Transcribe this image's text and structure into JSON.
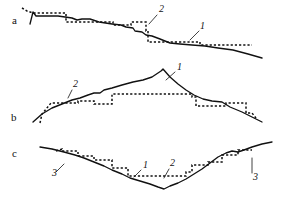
{
  "figure": {
    "width": 281,
    "height": 198,
    "background_color": "#ffffff",
    "stroke_color": "#111111",
    "panels": [
      {
        "id": "panel-a",
        "letter": "a",
        "letter_pos": [
          12,
          24
        ],
        "description": "Descending profile with stepped dashed approximation",
        "callouts": [
          {
            "label": "2",
            "pos": [
              159,
              12
            ],
            "leader": "M 157 15 L 149 24"
          },
          {
            "label": "1",
            "pos": [
              200,
              29
            ],
            "leader": "M 199 31 L 190 40"
          }
        ]
      },
      {
        "id": "panel-b",
        "letter": "b",
        "letter_pos": [
          11,
          121
        ],
        "description": "Peak (ridge) profile with stepped dashed approximation",
        "callouts": [
          {
            "label": "1",
            "pos": [
              177,
              70
            ],
            "leader": "M 175 72 L 166 80"
          },
          {
            "label": "2",
            "pos": [
              73,
              87
            ],
            "leader": "M 72 90 L 68 98"
          }
        ]
      },
      {
        "id": "panel-c",
        "letter": "c",
        "letter_pos": [
          12,
          157
        ],
        "description": "Valley (trough) profile with stepped dashed approximation",
        "callouts": [
          {
            "label": "3",
            "pos": [
              52,
              176
            ],
            "leader": "M 56 172 L 64 164"
          },
          {
            "label": "1",
            "pos": [
              143,
              168
            ],
            "leader": "M 141 170 L 134 177"
          },
          {
            "label": "2",
            "pos": [
              170,
              166
            ],
            "leader": "M 169 169 L 164 178"
          },
          {
            "label": "3",
            "pos": [
              253,
              177
            ],
            "leader": "M 252 173 L 252 158"
          }
        ]
      }
    ],
    "chart_data": {
      "type": "line",
      "title": "",
      "xlabel": "",
      "ylabel": "",
      "grid": false,
      "legend": "none",
      "series": [
        {
          "name": "a-solid-profile",
          "style": "solid",
          "points": [
            [
              30,
              24
            ],
            [
              33,
              12
            ],
            [
              36,
              16
            ],
            [
              41,
              16
            ],
            [
              50,
              16
            ],
            [
              58,
              16
            ],
            [
              65,
              17
            ],
            [
              72,
              18
            ],
            [
              77,
              20
            ],
            [
              82,
              19
            ],
            [
              90,
              19
            ],
            [
              99,
              22
            ],
            [
              112,
              24
            ],
            [
              121,
              25
            ],
            [
              126,
              27
            ],
            [
              133,
              28
            ],
            [
              135,
              31
            ],
            [
              142,
              32
            ],
            [
              146,
              35
            ],
            [
              152,
              36
            ],
            [
              160,
              39
            ],
            [
              170,
              43
            ],
            [
              180,
              44
            ],
            [
              192,
              45
            ],
            [
              205,
              46
            ],
            [
              218,
              48
            ],
            [
              233,
              50
            ],
            [
              248,
              54
            ],
            [
              262,
              58
            ]
          ]
        },
        {
          "name": "a-dashed-approximation",
          "style": "dashed",
          "points": [
            [
              22,
              8
            ],
            [
              27,
              11
            ],
            [
              33,
              13
            ],
            [
              36,
              13
            ],
            [
              45,
              13
            ],
            [
              56,
              13
            ],
            [
              64,
              13
            ],
            [
              66,
              13
            ],
            [
              66,
              22
            ],
            [
              70,
              22
            ],
            [
              80,
              22
            ],
            [
              92,
              22
            ],
            [
              104,
              22
            ],
            [
              113,
              22
            ],
            [
              113,
              25
            ],
            [
              122,
              25
            ],
            [
              131,
              25
            ],
            [
              131,
              22
            ],
            [
              140,
              22
            ],
            [
              146,
              22
            ],
            [
              146,
              31
            ],
            [
              148,
              31
            ],
            [
              148,
              42
            ],
            [
              156,
              42
            ],
            [
              168,
              42
            ],
            [
              180,
              42
            ],
            [
              192,
              42
            ],
            [
              200,
              42
            ],
            [
              200,
              45
            ],
            [
              212,
              45
            ],
            [
              226,
              45
            ],
            [
              240,
              45
            ],
            [
              252,
              45
            ]
          ]
        },
        {
          "name": "b-solid-profile",
          "style": "solid",
          "points": [
            [
              33,
              122
            ],
            [
              42,
              114
            ],
            [
              52,
              108
            ],
            [
              62,
              104
            ],
            [
              72,
              100
            ],
            [
              80,
              98
            ],
            [
              88,
              95
            ],
            [
              94,
              93
            ],
            [
              100,
              93
            ],
            [
              104,
              90
            ],
            [
              112,
              88
            ],
            [
              122,
              85
            ],
            [
              133,
              82
            ],
            [
              143,
              80
            ],
            [
              152,
              77
            ],
            [
              161,
              71
            ],
            [
              163,
              69
            ],
            [
              170,
              77
            ],
            [
              178,
              84
            ],
            [
              186,
              90
            ],
            [
              194,
              95
            ],
            [
              203,
              99
            ],
            [
              212,
              101
            ],
            [
              222,
              102
            ],
            [
              230,
              107
            ],
            [
              242,
              112
            ],
            [
              252,
              117
            ],
            [
              262,
              122
            ]
          ]
        },
        {
          "name": "b-dashed-approximation",
          "style": "dashed",
          "points": [
            [
              40,
              123
            ],
            [
              42,
              114
            ],
            [
              51,
              103
            ],
            [
              60,
              103
            ],
            [
              70,
              103
            ],
            [
              78,
              103
            ],
            [
              78,
              101
            ],
            [
              86,
              101
            ],
            [
              94,
              101
            ],
            [
              94,
              104
            ],
            [
              104,
              104
            ],
            [
              112,
              104
            ],
            [
              112,
              94
            ],
            [
              122,
              94
            ],
            [
              134,
              94
            ],
            [
              146,
              94
            ],
            [
              158,
              94
            ],
            [
              170,
              94
            ],
            [
              180,
              94
            ],
            [
              192,
              94
            ],
            [
              192,
              97
            ],
            [
              196,
              97
            ],
            [
              196,
              106
            ],
            [
              204,
              106
            ],
            [
              214,
              106
            ],
            [
              226,
              106
            ],
            [
              226,
              103
            ],
            [
              236,
              103
            ],
            [
              246,
              103
            ],
            [
              246,
              113
            ],
            [
              252,
              113
            ],
            [
              256,
              118
            ]
          ]
        },
        {
          "name": "c-solid-profile",
          "style": "solid",
          "points": [
            [
              40,
              147
            ],
            [
              52,
              149
            ],
            [
              64,
              152
            ],
            [
              75,
              155
            ],
            [
              84,
              158
            ],
            [
              94,
              162
            ],
            [
              104,
              166
            ],
            [
              112,
              170
            ],
            [
              122,
              174
            ],
            [
              130,
              178
            ],
            [
              140,
              181
            ],
            [
              150,
              184
            ],
            [
              158,
              187
            ],
            [
              164,
              189
            ],
            [
              170,
              186
            ],
            [
              178,
              183
            ],
            [
              186,
              179
            ],
            [
              194,
              174
            ],
            [
              202,
              169
            ],
            [
              210,
              163
            ],
            [
              218,
              157
            ],
            [
              226,
              153
            ],
            [
              232,
              151
            ],
            [
              238,
              152
            ],
            [
              244,
              150
            ],
            [
              252,
              147
            ],
            [
              262,
              144
            ],
            [
              272,
              142
            ]
          ]
        },
        {
          "name": "c-dashed-approximation",
          "style": "dashed",
          "points": [
            [
              56,
              151
            ],
            [
              62,
              149
            ],
            [
              62,
              151
            ],
            [
              72,
              151
            ],
            [
              78,
              151
            ],
            [
              78,
              156
            ],
            [
              86,
              156
            ],
            [
              94,
              156
            ],
            [
              94,
              160
            ],
            [
              104,
              160
            ],
            [
              112,
              160
            ],
            [
              112,
              168
            ],
            [
              120,
              168
            ],
            [
              128,
              168
            ],
            [
              128,
              176
            ],
            [
              138,
              176
            ],
            [
              150,
              176
            ],
            [
              162,
              176
            ],
            [
              174,
              176
            ],
            [
              186,
              176
            ],
            [
              186,
              172
            ],
            [
              192,
              172
            ],
            [
              192,
              165
            ],
            [
              200,
              165
            ],
            [
              208,
              165
            ],
            [
              208,
              162
            ],
            [
              216,
              162
            ],
            [
              222,
              162
            ],
            [
              222,
              155
            ],
            [
              230,
              155
            ],
            [
              238,
              155
            ],
            [
              238,
              150
            ],
            [
              246,
              150
            ],
            [
              252,
              150
            ]
          ]
        }
      ]
    }
  }
}
